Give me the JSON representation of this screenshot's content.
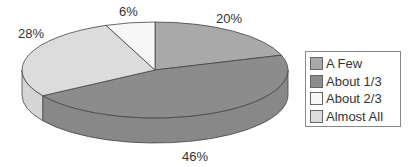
{
  "chart_data": {
    "type": "pie",
    "style": "3d",
    "title": "",
    "categories": [
      "A Few",
      "About 1/3",
      "About 2/3",
      "Almost All"
    ],
    "values": [
      20,
      46,
      6,
      28
    ],
    "value_labels": [
      "20%",
      "46%",
      "6%",
      "28%"
    ],
    "colors": [
      "#a9a9a9",
      "#8c8c8c",
      "#f7f7f7",
      "#dcdcdc"
    ],
    "legend_position": "right"
  },
  "labels": {
    "a_few": "20%",
    "about_1_3": "46%",
    "about_2_3": "6%",
    "almost_all": "28%"
  },
  "legend": {
    "items": [
      {
        "label": "A Few",
        "color": "#a9a9a9"
      },
      {
        "label": "About 1/3",
        "color": "#8c8c8c"
      },
      {
        "label": "About 2/3",
        "color": "#f7f7f7"
      },
      {
        "label": "Almost All",
        "color": "#dcdcdc"
      }
    ]
  }
}
